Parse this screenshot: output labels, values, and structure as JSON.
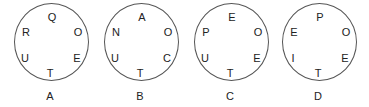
{
  "figures": [
    {
      "caption": "A",
      "letters": {
        "top": "Q",
        "upper_right": "O",
        "lower_right": "E",
        "bottom": "T",
        "lower_left": "U",
        "upper_left": "R"
      }
    },
    {
      "caption": "B",
      "letters": {
        "top": "A",
        "upper_right": "O",
        "lower_right": "C",
        "bottom": "T",
        "lower_left": "U",
        "upper_left": "N"
      }
    },
    {
      "caption": "C",
      "letters": {
        "top": "E",
        "upper_right": "O",
        "lower_right": "E",
        "bottom": "T",
        "lower_left": "U",
        "upper_left": "P"
      }
    },
    {
      "caption": "D",
      "letters": {
        "top": "P",
        "upper_right": "O",
        "lower_right": "E",
        "bottom": "T",
        "lower_left": "I",
        "upper_left": "E"
      }
    }
  ]
}
